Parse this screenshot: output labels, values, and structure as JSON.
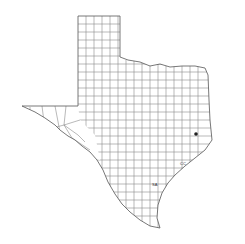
{
  "map": {
    "title": "Texas counties",
    "region": "Texas",
    "background": "#ffffff",
    "line_color": "#7a7a7a",
    "marker": {
      "label": "point",
      "x": 196,
      "y": 134,
      "color": "#222222"
    },
    "labels": [
      {
        "text": "SA",
        "x": 152,
        "y": 186
      },
      {
        "text": "CC",
        "x": 180,
        "y": 165
      }
    ]
  }
}
